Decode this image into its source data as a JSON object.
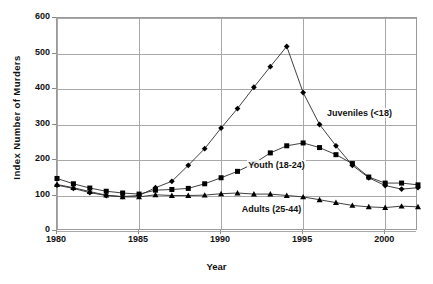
{
  "chart_data": {
    "type": "line",
    "title": "",
    "xlabel": "Year",
    "ylabel": "Index Number of Murders",
    "xlim": [
      1980,
      2002
    ],
    "ylim": [
      0,
      600
    ],
    "yticks": [
      0,
      100,
      200,
      300,
      400,
      500,
      600
    ],
    "xticks": [
      1980,
      1985,
      1990,
      1995,
      2000
    ],
    "grid": true,
    "legend_position": "inline-annotations",
    "x": [
      1980,
      1981,
      1982,
      1983,
      1984,
      1985,
      1986,
      1987,
      1988,
      1989,
      1990,
      1991,
      1992,
      1993,
      1994,
      1995,
      1996,
      1997,
      1998,
      1999,
      2000,
      2001,
      2002
    ],
    "series": [
      {
        "name": "Juveniles (<18)",
        "marker": "diamond",
        "values": [
          129,
          120,
          108,
          100,
          97,
          100,
          122,
          140,
          185,
          232,
          290,
          345,
          405,
          463,
          520,
          390,
          300,
          240,
          185,
          150,
          128,
          118,
          122
        ]
      },
      {
        "name": "Youth (18-24)",
        "marker": "square",
        "values": [
          148,
          133,
          121,
          112,
          107,
          104,
          115,
          117,
          120,
          133,
          150,
          168,
          190,
          220,
          240,
          248,
          235,
          215,
          190,
          152,
          135,
          135,
          130
        ]
      },
      {
        "name": "Adults (25-44)",
        "marker": "triangle",
        "values": [
          131,
          122,
          111,
          101,
          96,
          96,
          102,
          100,
          100,
          101,
          105,
          107,
          104,
          104,
          100,
          96,
          88,
          80,
          72,
          68,
          66,
          70,
          68
        ]
      }
    ],
    "annotations": [
      {
        "text": "Juveniles (<18)",
        "x": 1996.4,
        "y": 330
      },
      {
        "text": "Youth (18-24)",
        "x": 1991.6,
        "y": 182
      },
      {
        "text": "Adults (25-44)",
        "x": 1991.2,
        "y": 60
      }
    ],
    "colors": {
      "line": "#2b2b2b",
      "marker": "#000000",
      "grid": "#a8a8a8",
      "axis": "#7a7a7a",
      "background": "#ffffff",
      "text": "#111111"
    }
  },
  "axes": {
    "y_title": "Index Number of Murders",
    "x_title": "Year",
    "y_tick_labels": [
      "600",
      "500",
      "400",
      "300",
      "200",
      "100",
      "0"
    ],
    "x_tick_labels": [
      "1980",
      "1985",
      "1990",
      "1995",
      "2000"
    ]
  }
}
